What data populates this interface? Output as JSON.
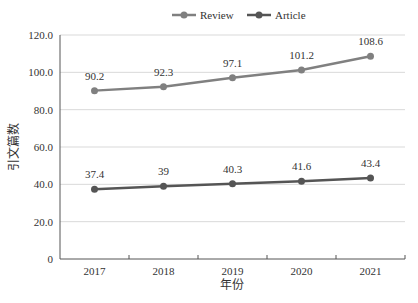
{
  "chart_data": {
    "type": "line",
    "title": "",
    "xlabel": "年份",
    "ylabel": "引文篇数",
    "categories": [
      "2017",
      "2018",
      "2019",
      "2020",
      "2021"
    ],
    "series": [
      {
        "name": "Review",
        "values": [
          90.2,
          92.3,
          97.1,
          101.2,
          108.6
        ],
        "color": "#808080",
        "labels": [
          "90.2",
          "92.3",
          "97.1",
          "101.2",
          "108.6"
        ]
      },
      {
        "name": "Article",
        "values": [
          37.4,
          39,
          40.3,
          41.6,
          43.4
        ],
        "color": "#555555",
        "labels": [
          "37.4",
          "39",
          "40.3",
          "41.6",
          "43.4"
        ]
      }
    ],
    "ylim": [
      0,
      120
    ],
    "yticks": [
      "0",
      "20.0",
      "40.0",
      "60.0",
      "80.0",
      "100.0",
      "120.0"
    ],
    "grid": true,
    "legend_position": "top"
  }
}
